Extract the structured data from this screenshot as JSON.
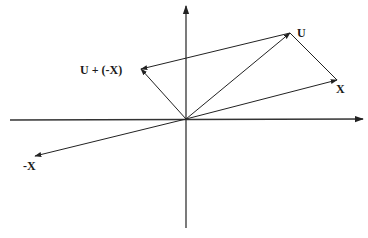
{
  "diagram": {
    "type": "vector-diagram",
    "colors": {
      "line": "#222222",
      "axis": "#333333",
      "background": "#ffffff"
    },
    "origin": {
      "x": 186,
      "y": 119
    },
    "axes": {
      "horizontal": {
        "from": [
          10,
          120
        ],
        "to": [
          363,
          119
        ]
      },
      "vertical": {
        "from": [
          186,
          228
        ],
        "to": [
          186,
          6
        ]
      }
    },
    "vectors": [
      {
        "id": "U",
        "label": "U",
        "from": [
          186,
          119
        ],
        "to": [
          290,
          33
        ],
        "label_pos": [
          297,
          37
        ]
      },
      {
        "id": "X",
        "label": "X",
        "from": [
          186,
          119
        ],
        "to": [
          337,
          80
        ],
        "label_pos": [
          336,
          93
        ]
      },
      {
        "id": "neg-X",
        "label": "-X",
        "from": [
          186,
          119
        ],
        "to": [
          35,
          156
        ],
        "label_pos": [
          23,
          170
        ]
      },
      {
        "id": "U-plus-neg-X",
        "label": "U + (-X)",
        "from": [
          290,
          33
        ],
        "to": [
          141,
          69
        ],
        "label_pos": [
          80,
          74
        ]
      },
      {
        "id": "U-minus-X-from-origin",
        "label": "",
        "from": [
          186,
          119
        ],
        "to": [
          141,
          69
        ]
      }
    ],
    "segments": [
      {
        "id": "U-to-X",
        "from": [
          290,
          33
        ],
        "to": [
          337,
          80
        ]
      }
    ]
  }
}
